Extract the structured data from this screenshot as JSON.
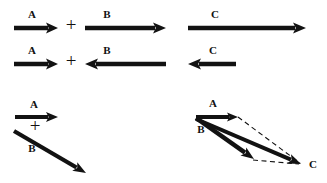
{
  "figure": {
    "background_color": "#ffffff",
    "ink_color": "#121212",
    "plus_symbol": "+",
    "rows": [
      {
        "id": "row-same-direction",
        "operands": [
          {
            "name": "vector-a",
            "label": "A",
            "direction": "right",
            "x1": 14,
            "y1": 28,
            "x2": 58,
            "y2": 28,
            "shaft_width": 4.6,
            "head_length": 12,
            "head_width": 11,
            "label_x": 32,
            "label_y": 18
          },
          {
            "name": "vector-b",
            "label": "B",
            "direction": "right",
            "x1": 85,
            "y1": 28,
            "x2": 166,
            "y2": 28,
            "shaft_width": 4.6,
            "head_length": 13,
            "head_width": 11,
            "label_x": 107,
            "label_y": 18
          }
        ],
        "plus": {
          "x": 71,
          "y": 27
        },
        "result": {
          "name": "vector-c",
          "label": "C",
          "direction": "right",
          "x1": 188,
          "y1": 28,
          "x2": 306,
          "y2": 28,
          "shaft_width": 4.6,
          "head_length": 13,
          "head_width": 11,
          "label_x": 215,
          "label_y": 18
        }
      },
      {
        "id": "row-opposite-direction",
        "operands": [
          {
            "name": "vector-a",
            "label": "A",
            "direction": "right",
            "x1": 14,
            "y1": 64,
            "x2": 58,
            "y2": 64,
            "shaft_width": 4.6,
            "head_length": 12,
            "head_width": 11,
            "label_x": 32,
            "label_y": 54
          },
          {
            "name": "vector-b",
            "label": "B",
            "direction": "left",
            "x1": 166,
            "y1": 64,
            "x2": 85,
            "y2": 64,
            "shaft_width": 4.6,
            "head_length": 13,
            "head_width": 11,
            "label_x": 107,
            "label_y": 54
          }
        ],
        "plus": {
          "x": 71,
          "y": 63
        },
        "result": {
          "name": "vector-c",
          "label": "C",
          "direction": "left",
          "x1": 236,
          "y1": 64,
          "x2": 188,
          "y2": 64,
          "shaft_width": 4.6,
          "head_length": 13,
          "head_width": 11,
          "label_x": 213,
          "label_y": 54
        }
      }
    ],
    "bottom_left": {
      "id": "row-angled-operands",
      "plus": {
        "x": 35,
        "y": 128
      },
      "operands": [
        {
          "name": "vector-a",
          "label": "A",
          "direction": "right",
          "x1": 15,
          "y1": 117,
          "x2": 58,
          "y2": 117,
          "shaft_width": 4.2,
          "head_length": 12,
          "head_width": 10,
          "label_x": 34,
          "label_y": 108
        },
        {
          "name": "vector-b",
          "label": "B",
          "direction": "down-right",
          "x1": 14,
          "y1": 131,
          "x2": 86,
          "y2": 173,
          "shaft_width": 4.2,
          "head_length": 13,
          "head_width": 10,
          "label_x": 32,
          "label_y": 152
        }
      ]
    },
    "bottom_right": {
      "id": "parallelogram-resultant",
      "origin": {
        "x": 196,
        "y": 117
      },
      "vectors": [
        {
          "name": "vector-a",
          "label": "A",
          "x1": 196,
          "y1": 117,
          "x2": 238,
          "y2": 117,
          "shaft_width": 4.2,
          "head_length": 11,
          "head_width": 9,
          "label_x": 213,
          "label_y": 107
        },
        {
          "name": "vector-b",
          "label": "B",
          "x1": 196,
          "y1": 118,
          "x2": 254,
          "y2": 159,
          "shaft_width": 4.4,
          "head_length": 13,
          "head_width": 10,
          "label_x": 201,
          "label_y": 133
        },
        {
          "name": "vector-c-resultant",
          "label": "C",
          "x1": 196,
          "y1": 119,
          "x2": 301,
          "y2": 164,
          "shaft_width": 4.0,
          "head_length": 13,
          "head_width": 10,
          "label_x": 313,
          "label_y": 168
        }
      ],
      "construction_lines": [
        {
          "name": "dashed-a-to-c",
          "x1": 238,
          "y1": 117,
          "x2": 300,
          "y2": 163
        },
        {
          "name": "dashed-b-to-c",
          "x1": 253,
          "y1": 160,
          "x2": 299,
          "y2": 164
        }
      ]
    }
  }
}
